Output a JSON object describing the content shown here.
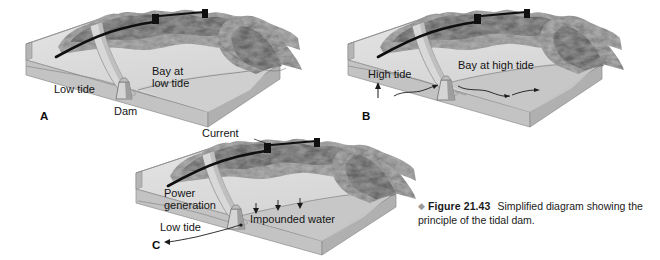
{
  "figure": {
    "bullet_glyph": "◆",
    "number_label": "Figure 21.43",
    "caption_line1": "Simplified diagram",
    "caption_line2": "showing the principle of the tidal dam.",
    "caption_full": "Figure 21.43 Simplified diagram showing the principle of the tidal dam."
  },
  "colors": {
    "background": "#ffffff",
    "block_top": "#dcdcdc",
    "block_top_light": "#e6e6e6",
    "block_side": "#bdbdbd",
    "block_side_dark": "#a8a8a8",
    "water": "#c9c9c9",
    "water_dark": "#b4b4b4",
    "terrain_light": "#b9b9b9",
    "terrain_mid": "#8f8f8f",
    "terrain_dark": "#5d5d5d",
    "dam_face": "#cfcfcf",
    "dam_shadow": "#9b9b9b",
    "ink": "#141414",
    "caption_bullet": "#9a9a9a"
  },
  "panels": [
    {
      "id": "A",
      "letter": "A",
      "state": "low-tide",
      "labels": [
        {
          "name": "low-tide",
          "text": "Low tide"
        },
        {
          "name": "bay-at-low-tide-line1",
          "text": "Bay at"
        },
        {
          "name": "bay-at-low-tide-line2",
          "text": "low tide"
        },
        {
          "name": "dam",
          "text": "Dam"
        }
      ]
    },
    {
      "id": "B",
      "letter": "B",
      "state": "high-tide",
      "labels": [
        {
          "name": "high-tide",
          "text": "High tide"
        },
        {
          "name": "bay-at-high-tide",
          "text": "Bay at high tide"
        }
      ]
    },
    {
      "id": "C",
      "letter": "C",
      "state": "power-generation",
      "labels": [
        {
          "name": "current",
          "text": "Current"
        },
        {
          "name": "power-generation-line1",
          "text": "Power"
        },
        {
          "name": "power-generation-line2",
          "text": "generation"
        },
        {
          "name": "impounded-water",
          "text": "Impounded water"
        },
        {
          "name": "low-tide",
          "text": "Low tide"
        }
      ]
    }
  ]
}
